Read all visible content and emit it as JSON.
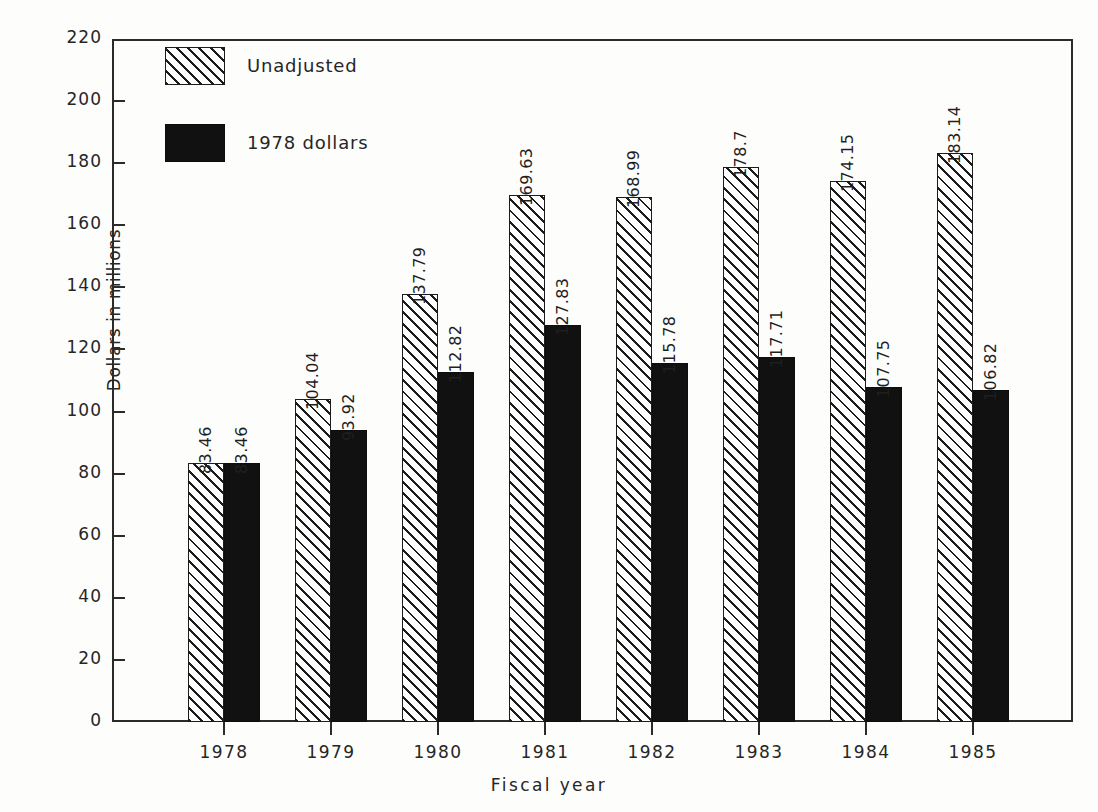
{
  "chart_data": {
    "type": "bar",
    "title": "",
    "xlabel": "Fiscal year",
    "ylabel": "Dollars in millions",
    "categories": [
      "1978",
      "1979",
      "1980",
      "1981",
      "1982",
      "1983",
      "1984",
      "1985"
    ],
    "series": [
      {
        "name": "Unadjusted",
        "values": [
          83.46,
          104.04,
          137.79,
          169.63,
          168.99,
          178.7,
          174.15,
          183.14
        ],
        "labels": [
          "83.46",
          "104.04",
          "137.79",
          "169.63",
          "168.99",
          "178.7",
          "174.15",
          "183.14"
        ],
        "fill": "hatched-diagonal"
      },
      {
        "name": "1978 dollars",
        "values": [
          83.46,
          93.92,
          112.82,
          127.83,
          115.78,
          117.71,
          107.75,
          106.82
        ],
        "labels": [
          "83.46",
          "93.92",
          "112.82",
          "127.83",
          "115.78",
          "117.71",
          "107.75",
          "106.82"
        ],
        "fill": "solid-black"
      }
    ],
    "ylim": [
      0,
      220
    ],
    "yticks": [
      0,
      20,
      40,
      60,
      80,
      100,
      120,
      140,
      160,
      180,
      200,
      220
    ],
    "ytick_labels": [
      "0",
      "20",
      "40",
      "60",
      "80",
      "100",
      "120",
      "140",
      "160",
      "180",
      "200",
      "220"
    ],
    "grid": false,
    "legend_position": "top-left"
  },
  "legend": {
    "items": [
      {
        "label": "Unadjusted",
        "swatch": "hatched-diagonal"
      },
      {
        "label": "1978 dollars",
        "swatch": "solid-black"
      }
    ]
  },
  "colors": {
    "background": "#fdfdfc",
    "axis": "#2b2b2b",
    "text": "#262626",
    "bar_unadjusted_fill": "#fefefe",
    "bar_unadjusted_hatch": "#1c1c1c",
    "bar_adjusted": "#111111"
  }
}
